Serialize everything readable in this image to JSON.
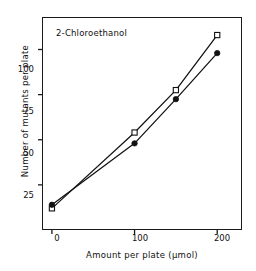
{
  "chart_data": {
    "type": "line",
    "title": "",
    "annotation": "2-Chloroethanol",
    "xlabel": "Amount per plate (µmol)",
    "ylabel": "Number of mutants per plate",
    "xlim": [
      -12,
      230
    ],
    "ylim": [
      0,
      118
    ],
    "xticks": [
      0,
      100,
      200
    ],
    "xtick_labels": [
      "0",
      "100",
      "200"
    ],
    "yticks": [
      25,
      50,
      75,
      100
    ],
    "ytick_labels": [
      "25",
      "50",
      "75",
      "100"
    ],
    "grid": false,
    "legend": "none",
    "series": [
      {
        "name": "open-square-series",
        "marker": "open-square",
        "color": "#111111",
        "x": [
          0,
          100,
          150,
          200
        ],
        "values": [
          12,
          54,
          77.5,
          108
        ]
      },
      {
        "name": "filled-circle-series",
        "marker": "filled-circle",
        "color": "#111111",
        "x": [
          0,
          100,
          150,
          200
        ],
        "values": [
          14,
          48,
          72.5,
          98
        ]
      }
    ]
  },
  "axes": {
    "x_tick_labels": [
      "0",
      "100",
      "200"
    ],
    "y_tick_labels": [
      "25",
      "50",
      "75",
      "100"
    ],
    "x_title": "Amount per plate (µmol)",
    "y_title": "Number of mutants per plate"
  },
  "annotation": {
    "compound_label": "2-Chloroethanol"
  },
  "colors": {
    "axis": "#1a1a1a",
    "ink": "#111111",
    "background": "#ffffff"
  }
}
